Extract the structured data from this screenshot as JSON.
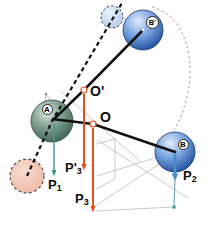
{
  "diagram": {
    "spheres": {
      "a_label": "A",
      "b_label": "B",
      "b_prime_label": "B'"
    },
    "points": {
      "o_label": "O",
      "o_prime_label": "O'"
    },
    "forces": {
      "p1": {
        "main": "P",
        "sub": "1"
      },
      "p2": {
        "main": "P",
        "sub": "2"
      },
      "p3": {
        "main": "P",
        "sub": "3"
      },
      "p3_prime": {
        "main": "P'",
        "sub": "3"
      }
    },
    "colors": {
      "lever_line": "#111111",
      "orange_arrow": "#e8501e",
      "teal_arrow": "#45948e",
      "blue_arrow": "#4a8fca",
      "sphere_a_dark": "#44685a",
      "sphere_b_dark": "#1f4d9e",
      "ghost_small_fill": "#cfe2f5",
      "ghost_pink_fill": "#f3c2b0",
      "construction_gray": "#b3b3b3"
    }
  }
}
